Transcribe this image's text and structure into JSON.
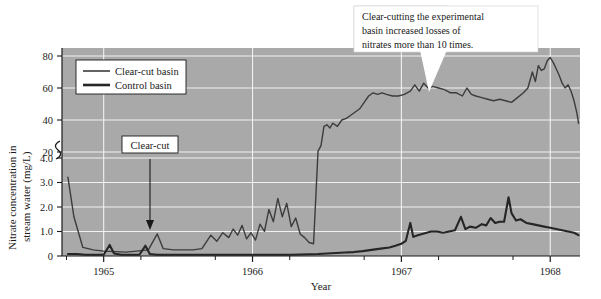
{
  "chart_data": {
    "type": "line",
    "title": "",
    "xlabel": "Year",
    "ylabel_line1": "Nitrate concentration in",
    "ylabel_line2": "stream water (mg/L)",
    "xlim": [
      1964.72,
      1968.2
    ],
    "x_tick_labels": [
      "1965",
      "1966",
      "1967",
      "1968"
    ],
    "x_tick_values": [
      1965,
      1966,
      1967,
      1968
    ],
    "x_minor_ticks": [
      1964.75,
      1965.25,
      1965.75,
      1966.25,
      1966.75,
      1967.25,
      1967.75
    ],
    "y_axis_note": "broken axis: lower segment 0-4.0 mg/L, upper segment 20-80 mg/L",
    "y_tick_labels": [
      "0",
      "1.0",
      "2.0",
      "3.0",
      "4.0",
      "20",
      "40",
      "60",
      "80"
    ],
    "y_tick_values": [
      0,
      1.0,
      2.0,
      3.0,
      4.0,
      20,
      40,
      60,
      80
    ],
    "y_break_between": [
      4.0,
      20
    ],
    "grid": true,
    "grid_color": "#f2f2f2",
    "plot_background": "#a9a9a9",
    "legend_position": "upper left",
    "series": [
      {
        "name": "Clear-cut basin",
        "color": "#3c3c3c",
        "line_width": 1.4,
        "points": [
          [
            1964.76,
            4.2
          ],
          [
            1964.8,
            1.6
          ],
          [
            1964.86,
            0.35
          ],
          [
            1964.93,
            0.25
          ],
          [
            1965.0,
            0.2
          ],
          [
            1965.08,
            0.18
          ],
          [
            1965.15,
            0.16
          ],
          [
            1965.22,
            0.2
          ],
          [
            1965.3,
            0.25
          ],
          [
            1965.36,
            0.9
          ],
          [
            1965.4,
            0.3
          ],
          [
            1965.47,
            0.25
          ],
          [
            1965.54,
            0.25
          ],
          [
            1965.6,
            0.25
          ],
          [
            1965.66,
            0.3
          ],
          [
            1965.72,
            0.85
          ],
          [
            1965.76,
            0.6
          ],
          [
            1965.8,
            0.95
          ],
          [
            1965.84,
            0.75
          ],
          [
            1965.87,
            1.1
          ],
          [
            1965.9,
            0.85
          ],
          [
            1965.93,
            1.25
          ],
          [
            1965.96,
            0.7
          ],
          [
            1965.99,
            0.95
          ],
          [
            1966.02,
            0.65
          ],
          [
            1966.05,
            1.3
          ],
          [
            1966.08,
            1.0
          ],
          [
            1966.11,
            1.9
          ],
          [
            1966.14,
            1.4
          ],
          [
            1966.17,
            2.35
          ],
          [
            1966.2,
            1.6
          ],
          [
            1966.23,
            2.15
          ],
          [
            1966.26,
            1.2
          ],
          [
            1966.29,
            1.55
          ],
          [
            1966.32,
            0.9
          ],
          [
            1966.35,
            0.75
          ],
          [
            1966.38,
            0.55
          ],
          [
            1966.41,
            0.5
          ],
          [
            1966.44,
            20.5
          ],
          [
            1966.46,
            24
          ],
          [
            1966.48,
            36
          ],
          [
            1966.5,
            37
          ],
          [
            1966.52,
            35
          ],
          [
            1966.54,
            38
          ],
          [
            1966.57,
            36
          ],
          [
            1966.6,
            40
          ],
          [
            1966.63,
            41
          ],
          [
            1966.66,
            43
          ],
          [
            1966.69,
            45
          ],
          [
            1966.72,
            47
          ],
          [
            1966.75,
            51
          ],
          [
            1966.78,
            55
          ],
          [
            1966.81,
            57
          ],
          [
            1966.84,
            56
          ],
          [
            1966.87,
            57
          ],
          [
            1966.9,
            56
          ],
          [
            1966.94,
            55
          ],
          [
            1966.98,
            55
          ],
          [
            1967.02,
            56
          ],
          [
            1967.06,
            58
          ],
          [
            1967.09,
            62
          ],
          [
            1967.12,
            58
          ],
          [
            1967.15,
            63
          ],
          [
            1967.18,
            60
          ],
          [
            1967.21,
            61
          ],
          [
            1967.25,
            60
          ],
          [
            1967.29,
            59
          ],
          [
            1967.33,
            57
          ],
          [
            1967.37,
            57
          ],
          [
            1967.41,
            55
          ],
          [
            1967.44,
            60
          ],
          [
            1967.47,
            56
          ],
          [
            1967.5,
            55
          ],
          [
            1967.54,
            54
          ],
          [
            1967.58,
            53
          ],
          [
            1967.62,
            52
          ],
          [
            1967.66,
            53
          ],
          [
            1967.7,
            52
          ],
          [
            1967.74,
            51
          ],
          [
            1967.78,
            54
          ],
          [
            1967.82,
            57
          ],
          [
            1967.85,
            60
          ],
          [
            1967.88,
            70
          ],
          [
            1967.9,
            64
          ],
          [
            1967.92,
            74
          ],
          [
            1967.94,
            71
          ],
          [
            1967.96,
            72
          ],
          [
            1967.98,
            77
          ],
          [
            1968.0,
            79
          ],
          [
            1968.02,
            76
          ],
          [
            1968.04,
            72
          ],
          [
            1968.06,
            68
          ],
          [
            1968.08,
            63
          ],
          [
            1968.1,
            60
          ],
          [
            1968.12,
            62
          ],
          [
            1968.14,
            58
          ],
          [
            1968.16,
            52
          ],
          [
            1968.18,
            44
          ],
          [
            1968.19,
            38
          ]
        ]
      },
      {
        "name": "Control basin",
        "color": "#262626",
        "line_width": 2.1,
        "points": [
          [
            1964.76,
            0.08
          ],
          [
            1964.82,
            0.08
          ],
          [
            1964.88,
            0.05
          ],
          [
            1964.94,
            0.05
          ],
          [
            1965.0,
            0.05
          ],
          [
            1965.04,
            0.45
          ],
          [
            1965.07,
            0.1
          ],
          [
            1965.12,
            0.05
          ],
          [
            1965.18,
            0.05
          ],
          [
            1965.24,
            0.05
          ],
          [
            1965.28,
            0.42
          ],
          [
            1965.31,
            0.08
          ],
          [
            1965.36,
            0.05
          ],
          [
            1965.42,
            0.05
          ],
          [
            1965.48,
            0.05
          ],
          [
            1965.54,
            0.05
          ],
          [
            1965.6,
            0.05
          ],
          [
            1965.66,
            0.05
          ],
          [
            1965.72,
            0.05
          ],
          [
            1965.78,
            0.05
          ],
          [
            1965.84,
            0.05
          ],
          [
            1965.9,
            0.05
          ],
          [
            1965.96,
            0.05
          ],
          [
            1966.02,
            0.05
          ],
          [
            1966.08,
            0.05
          ],
          [
            1966.14,
            0.05
          ],
          [
            1966.2,
            0.05
          ],
          [
            1966.26,
            0.05
          ],
          [
            1966.32,
            0.06
          ],
          [
            1966.38,
            0.07
          ],
          [
            1966.44,
            0.08
          ],
          [
            1966.5,
            0.1
          ],
          [
            1966.56,
            0.12
          ],
          [
            1966.62,
            0.14
          ],
          [
            1966.68,
            0.16
          ],
          [
            1966.74,
            0.2
          ],
          [
            1966.8,
            0.25
          ],
          [
            1966.86,
            0.3
          ],
          [
            1966.92,
            0.35
          ],
          [
            1966.96,
            0.42
          ],
          [
            1967.0,
            0.5
          ],
          [
            1967.03,
            0.62
          ],
          [
            1967.06,
            1.35
          ],
          [
            1967.08,
            0.78
          ],
          [
            1967.11,
            0.85
          ],
          [
            1967.14,
            0.9
          ],
          [
            1967.17,
            0.95
          ],
          [
            1967.2,
            1.0
          ],
          [
            1967.24,
            1.0
          ],
          [
            1967.28,
            0.95
          ],
          [
            1967.32,
            1.0
          ],
          [
            1967.36,
            1.05
          ],
          [
            1967.4,
            1.6
          ],
          [
            1967.43,
            1.1
          ],
          [
            1967.46,
            1.2
          ],
          [
            1967.5,
            1.15
          ],
          [
            1967.54,
            1.3
          ],
          [
            1967.57,
            1.25
          ],
          [
            1967.6,
            1.55
          ],
          [
            1967.63,
            1.35
          ],
          [
            1967.66,
            1.4
          ],
          [
            1967.69,
            1.4
          ],
          [
            1967.72,
            2.4
          ],
          [
            1967.74,
            1.75
          ],
          [
            1967.77,
            1.45
          ],
          [
            1967.8,
            1.5
          ],
          [
            1967.84,
            1.35
          ],
          [
            1967.88,
            1.3
          ],
          [
            1967.92,
            1.25
          ],
          [
            1967.96,
            1.2
          ],
          [
            1968.0,
            1.15
          ],
          [
            1968.04,
            1.1
          ],
          [
            1968.08,
            1.05
          ],
          [
            1968.12,
            1.0
          ],
          [
            1968.16,
            0.95
          ],
          [
            1968.19,
            0.85
          ]
        ]
      }
    ],
    "annotations": [
      {
        "id": "callout-clearcutting",
        "lines": [
          "Clear-cutting the experimental",
          "basin increased losses of",
          "nitrates more than 10 times."
        ],
        "pointer": "points down-left to the clear-cut basin curve near 1967.1"
      },
      {
        "id": "label-clearcut",
        "text": "Clear-cut",
        "pointer": "arrow pointing down to x ≈ 1965.35 on the time axis"
      }
    ]
  },
  "legend": {
    "entries": [
      {
        "label": "Clear-cut basin",
        "style": "thin"
      },
      {
        "label": "Control basin",
        "style": "thick"
      }
    ]
  },
  "colors": {
    "plot_background": "#a9a9a9",
    "grid": "#f2f2f2",
    "axis": "#1a1a1a",
    "clear_cut_series": "#3c3c3c",
    "control_series": "#262626",
    "callout_background": "#ffffff",
    "page_background": "#ffffff"
  }
}
